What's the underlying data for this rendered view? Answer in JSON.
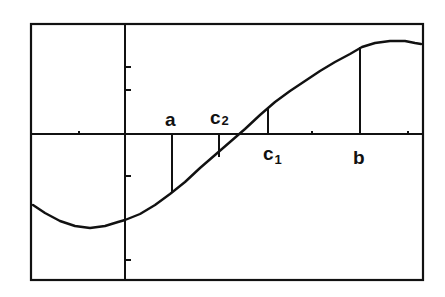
{
  "chart_data": {
    "type": "line",
    "title": "",
    "xlabel": "",
    "ylabel": "",
    "grid": false,
    "legend": null,
    "frame_px": {
      "left": 31,
      "top": 24,
      "right": 423,
      "bottom": 280
    },
    "axes_px": {
      "x_axis_y": 134,
      "y_axis_x": 125
    },
    "y_ticks_px": [
      67,
      90,
      176,
      260
    ],
    "x_ticks_px": [
      79,
      312,
      408
    ],
    "curve_points_px": [
      [
        33,
        205
      ],
      [
        45,
        213
      ],
      [
        60,
        221
      ],
      [
        75,
        226
      ],
      [
        90,
        228
      ],
      [
        105,
        226
      ],
      [
        118,
        222
      ],
      [
        125,
        220
      ],
      [
        140,
        214
      ],
      [
        155,
        205
      ],
      [
        170,
        194
      ],
      [
        185,
        182
      ],
      [
        200,
        168
      ],
      [
        215,
        155
      ],
      [
        230,
        142
      ],
      [
        245,
        129
      ],
      [
        260,
        115
      ],
      [
        275,
        102
      ],
      [
        290,
        91
      ],
      [
        305,
        81
      ],
      [
        320,
        71
      ],
      [
        335,
        62
      ],
      [
        350,
        54
      ],
      [
        362,
        47
      ],
      [
        375,
        43
      ],
      [
        390,
        41
      ],
      [
        405,
        41
      ],
      [
        415,
        43
      ],
      [
        421,
        44
      ]
    ],
    "markers": [
      {
        "label": "a",
        "subscript": "",
        "x_px": 172,
        "curve_y_px": 193,
        "label_pos": "above-axis"
      },
      {
        "label": "c",
        "subscript": "2",
        "x_px": 219,
        "curve_y_px": 157,
        "label_pos": "above-axis"
      },
      {
        "label": "c",
        "subscript": "1",
        "x_px": 268,
        "curve_y_px": 109,
        "label_pos": "below-axis"
      },
      {
        "label": "b",
        "subscript": "",
        "x_px": 360,
        "curve_y_px": 47,
        "label_pos": "below-axis"
      }
    ]
  },
  "labels": {
    "a": "a",
    "c2_base": "c",
    "c2_sub": "2",
    "c1_base": "c",
    "c1_sub": "1",
    "b": "b"
  }
}
